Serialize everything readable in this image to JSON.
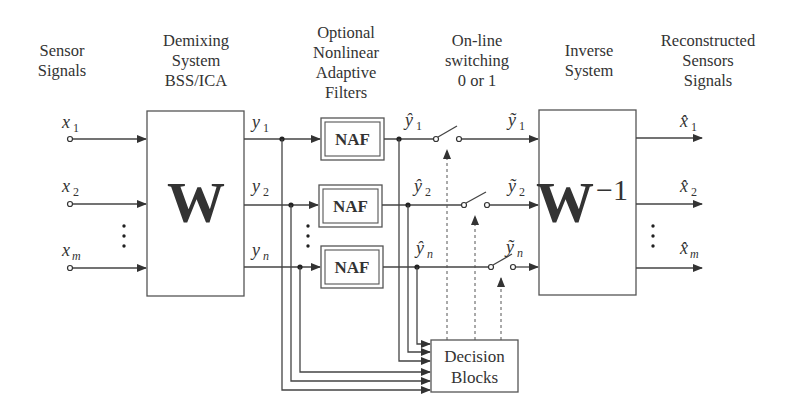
{
  "headers": {
    "sensor": [
      "Sensor",
      "Signals"
    ],
    "demixing": [
      "Demixing",
      "System",
      "BSS/ICA"
    ],
    "naf": [
      "Optional",
      "Nonlinear",
      "Adaptive",
      "Filters"
    ],
    "switching": [
      "On-line",
      "switching",
      "0 or 1"
    ],
    "inverse": [
      "Inverse",
      "System"
    ],
    "reconstructed": [
      "Reconstructed",
      "Sensors",
      "Signals"
    ]
  },
  "inputs": [
    {
      "base": "x",
      "sub": "1"
    },
    {
      "base": "x",
      "sub": "2"
    },
    {
      "base": "x",
      "sub": "m"
    }
  ],
  "demixing_block": {
    "label": "W"
  },
  "demixed_outputs": [
    {
      "base": "y",
      "sub": "1"
    },
    {
      "base": "y",
      "sub": "2"
    },
    {
      "base": "y",
      "sub": "n"
    }
  ],
  "filters": [
    {
      "label": "NAF"
    },
    {
      "label": "NAF"
    },
    {
      "label": "NAF"
    }
  ],
  "filtered_outputs": [
    {
      "base": "ŷ",
      "sub": "1"
    },
    {
      "base": "ŷ",
      "sub": "2"
    },
    {
      "base": "ŷ",
      "sub": "n"
    }
  ],
  "switched_outputs": [
    {
      "base": "ỹ",
      "sub": "1"
    },
    {
      "base": "ỹ",
      "sub": "2"
    },
    {
      "base": "ỹ",
      "sub": "n"
    }
  ],
  "inverse_block": {
    "label": "W",
    "superscript": "−1"
  },
  "reconstructed_outputs": [
    {
      "base": "x̂",
      "sub": "1"
    },
    {
      "base": "x̂",
      "sub": "2"
    },
    {
      "base": "x̂",
      "sub": "m"
    }
  ],
  "decision_block": {
    "label": [
      "Decision",
      "Blocks"
    ]
  },
  "ellipsis": "⋮"
}
